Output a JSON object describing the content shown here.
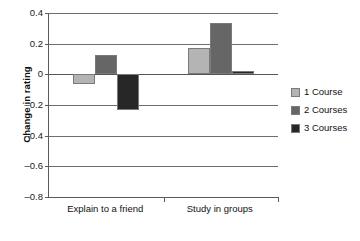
{
  "chart_data": {
    "type": "bar",
    "title": "",
    "xlabel": "",
    "ylabel": "Change in rating",
    "categories": [
      "Explain to a friend",
      "Study in groups"
    ],
    "series": [
      {
        "name": "1 Course",
        "values": [
          -0.06,
          0.17
        ],
        "color": "#b4b4b4"
      },
      {
        "name": "2 Courses",
        "values": [
          0.125,
          0.335
        ],
        "color": "#666666"
      },
      {
        "name": "3 Courses",
        "values": [
          -0.235,
          0.025
        ],
        "color": "#272727"
      }
    ],
    "ylim": [
      -0.8,
      0.4
    ],
    "y_ticks": [
      0.4,
      0.2,
      0,
      -0.2,
      -0.4,
      -0.6,
      -0.8
    ],
    "y_tick_labels": [
      "0.4",
      "0.2",
      "0",
      "–0.2",
      "–0.4",
      "–0.6",
      "–0.8"
    ],
    "grid": true,
    "legend_position": "right",
    "zero_line": 0
  },
  "axis": {
    "y_title": "Change in rating"
  },
  "legend": {
    "entries": [
      {
        "label": "1 Course"
      },
      {
        "label": "2 Courses"
      },
      {
        "label": "3 Courses"
      }
    ]
  }
}
